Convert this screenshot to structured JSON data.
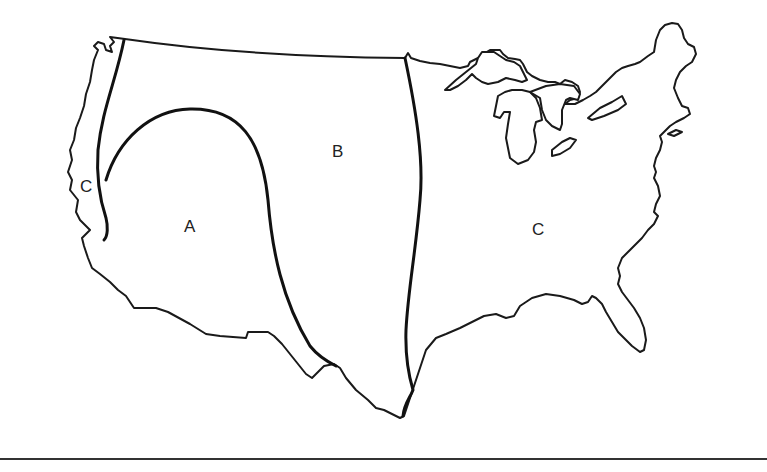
{
  "map": {
    "subject": "Outline map of the contiguous United States divided into regions",
    "regions": [
      {
        "id": "A",
        "label": "A",
        "location": "Interior Southwest / Great Basin"
      },
      {
        "id": "B",
        "label": "B",
        "location": "Northern Rockies and Great Plains"
      },
      {
        "id": "C-west",
        "label": "C",
        "location": "Pacific Coast strip"
      },
      {
        "id": "C-east",
        "label": "C",
        "location": "Eastern United States"
      }
    ],
    "colors": {
      "outline": "#1a1a1a",
      "boundary": "#111111",
      "background": "#ffffff"
    }
  }
}
